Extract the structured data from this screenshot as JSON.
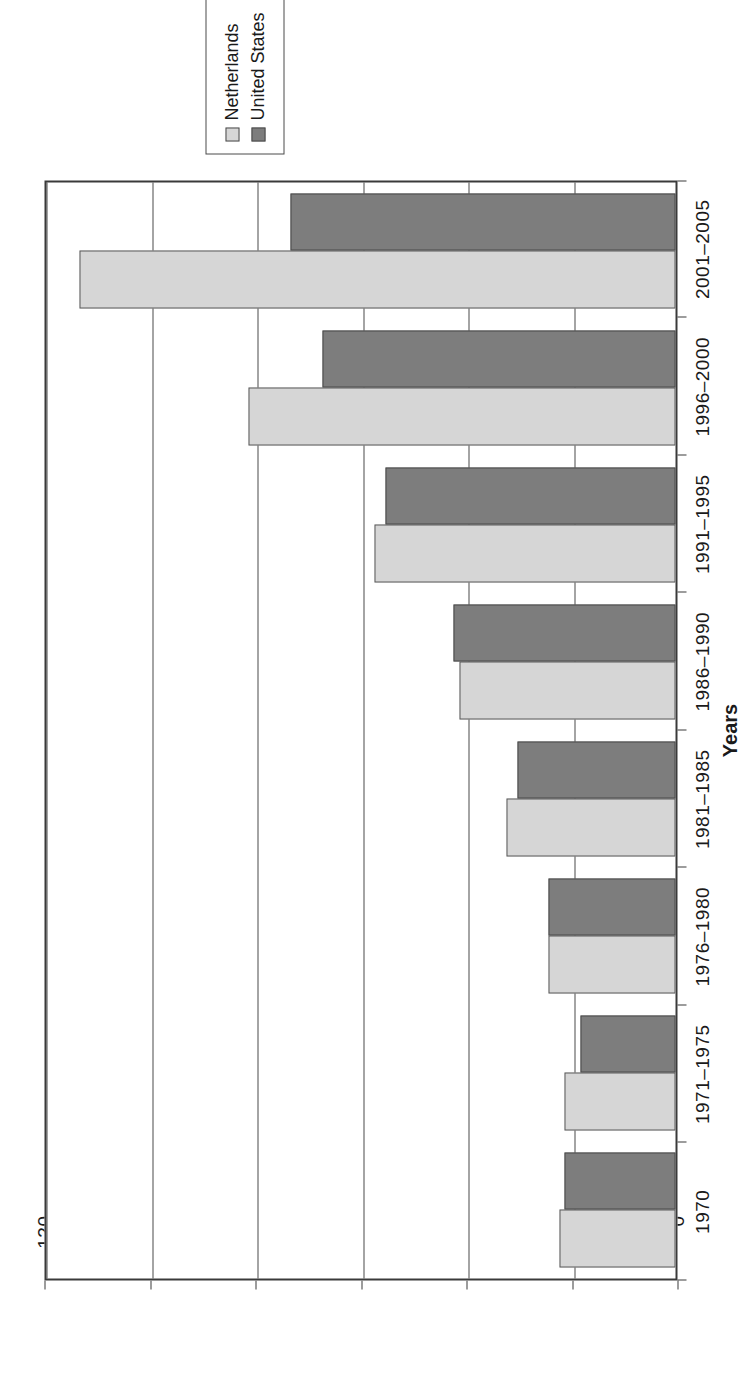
{
  "chart_data": {
    "type": "bar",
    "orientation": "vertical",
    "title": "",
    "xlabel": "Years",
    "ylabel": "Number",
    "ylim": [
      0,
      120
    ],
    "yticks": [
      0,
      20,
      40,
      60,
      80,
      100,
      120
    ],
    "ytick_labels": [
      "0",
      "20",
      "40",
      "60",
      "80",
      "100",
      "120"
    ],
    "grid": true,
    "legend_position": "right",
    "categories": [
      "1970",
      "1971–1975",
      "1976–1980",
      "1981–1985",
      "1986–1990",
      "1991–1995",
      "1996–2000",
      "2001–2005"
    ],
    "series": [
      {
        "name": "Netherlands",
        "color": "#d6d6d6",
        "values": [
          22,
          21,
          24,
          32,
          41,
          57,
          81,
          113
        ]
      },
      {
        "name": "United States",
        "color": "#7d7d7d",
        "values": [
          21,
          18,
          24,
          30,
          42,
          55,
          67,
          73
        ]
      }
    ]
  },
  "legend": {
    "items": [
      {
        "label": "Netherlands"
      },
      {
        "label": "United States"
      }
    ]
  },
  "axes": {
    "value_axis_title": "Number",
    "category_axis_title": "Years"
  },
  "colors": {
    "netherlands": "#d6d6d6",
    "united_states": "#7d7d7d",
    "frame": "#3a3a3a",
    "gridline": "#4a4a4a"
  }
}
